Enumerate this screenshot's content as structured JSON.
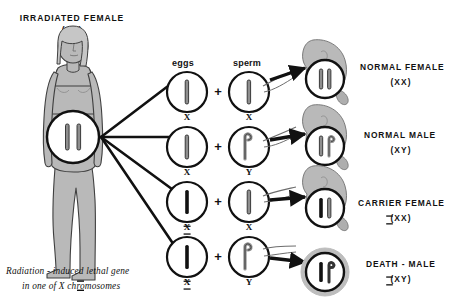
{
  "diagram": {
    "title_line1": "IRRADIATED FEMALE",
    "title_line2": "(XX)",
    "caption_line1": "Radiation - induced lethal gene",
    "caption_line2": "in one of X chromosomes",
    "column_headers": {
      "eggs": "eggs",
      "sperm": "sperm"
    },
    "plus_symbol": "+",
    "mother": {
      "name": "irradiated-female-figure",
      "karyotype": "XX",
      "chromosome_count": 2
    },
    "crosses": [
      {
        "egg_label": "X",
        "egg_irradiated": false,
        "sperm_label": "X",
        "sperm_type": "X",
        "outcome_label": "NORMAL FEMALE",
        "outcome_karyotype": "(XX)",
        "outcome_marked_index": -1,
        "outcome_viable": true,
        "embryo_chromosomes": [
          "X-gray",
          "X-gray"
        ]
      },
      {
        "egg_label": "X",
        "egg_irradiated": false,
        "sperm_label": "Y",
        "sperm_type": "Y",
        "outcome_label": "NORMAL MALE",
        "outcome_karyotype": "(XY)",
        "outcome_marked_index": -1,
        "outcome_viable": true,
        "embryo_chromosomes": [
          "X-gray",
          "Y-gray"
        ]
      },
      {
        "egg_label": "X",
        "egg_irradiated": true,
        "sperm_label": "X",
        "sperm_type": "X",
        "outcome_label": "CARRIER FEMALE",
        "outcome_karyotype": "(XX)",
        "outcome_marked_index": 0,
        "outcome_viable": true,
        "embryo_chromosomes": [
          "X-black",
          "X-gray"
        ]
      },
      {
        "egg_label": "X",
        "egg_irradiated": true,
        "sperm_label": "Y",
        "sperm_type": "Y",
        "outcome_label": "DEATH - MALE",
        "outcome_karyotype": "(XY)",
        "outcome_marked_index": 0,
        "outcome_viable": false,
        "embryo_chromosomes": [
          "X-black",
          "Y-gray"
        ]
      }
    ],
    "colors": {
      "body_fill": "#b9b9b9",
      "body_stroke": "#3a3a3a",
      "chromosome_gray": "#8e8e8e",
      "chromosome_black": "#111111",
      "circle_fill": "#ffffff",
      "circle_stroke": "#111111",
      "death_halo": "#bdbdbd",
      "text": "#111111",
      "background": "#ffffff"
    }
  }
}
